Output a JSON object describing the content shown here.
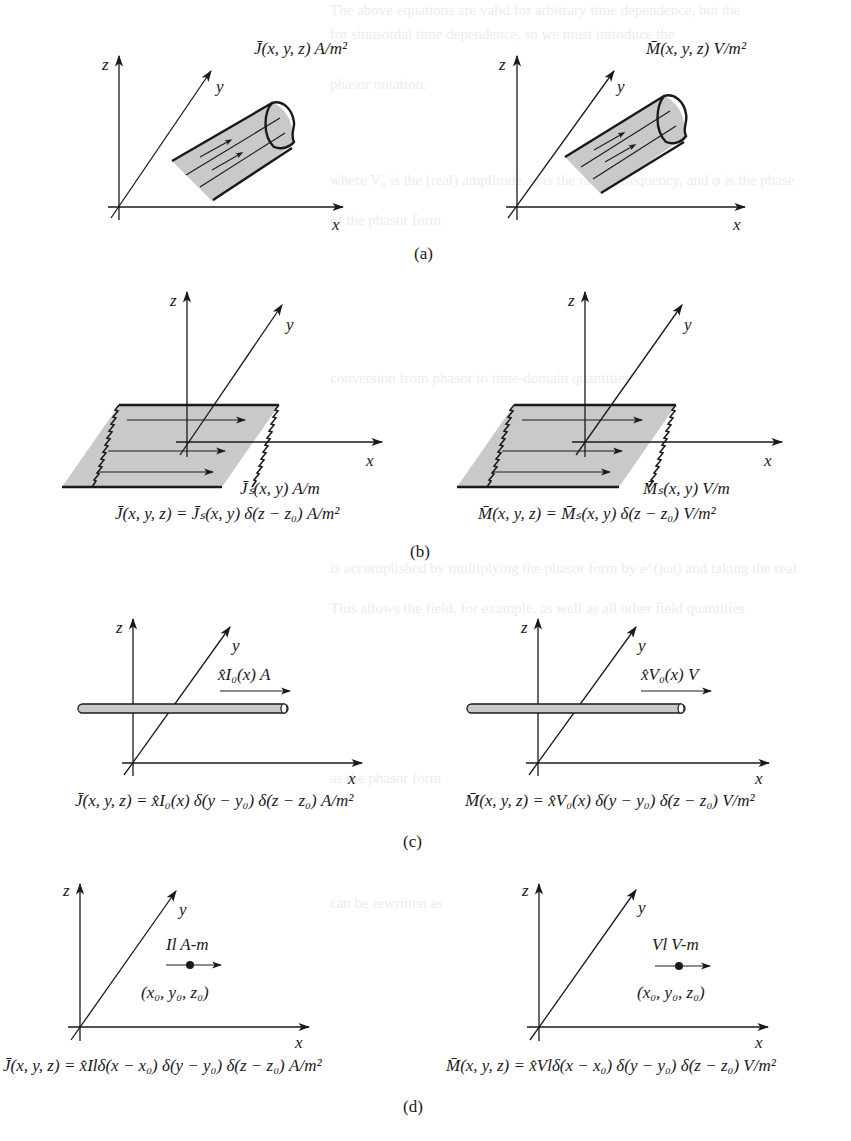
{
  "figure": {
    "panels": [
      {
        "id": "a",
        "caption": "(a)",
        "left": {
          "kind": "volume-current-tube",
          "label": "J̄(x, y, z) A/m²"
        },
        "right": {
          "kind": "volume-current-tube",
          "label": "M̄(x, y, z) V/m²"
        }
      },
      {
        "id": "b",
        "caption": "(b)",
        "left": {
          "kind": "surface-current-sheet",
          "sheet_label": "J̄ₛ(x, y) A/m",
          "equation": "J̄(x, y, z) = J̄ₛ(x, y) δ(z − z₀) A/m²"
        },
        "right": {
          "kind": "surface-current-sheet",
          "sheet_label": "M̄ₛ(x, y) V/m",
          "equation": "M̄(x, y, z) = M̄ₛ(x, y) δ(z − z₀) V/m²"
        }
      },
      {
        "id": "c",
        "caption": "(c)",
        "left": {
          "kind": "line-current",
          "line_label": "x̂I₀(x) A",
          "equation": "J̄(x, y, z) = x̂I₀(x) δ(y − y₀) δ(z − z₀) A/m²"
        },
        "right": {
          "kind": "line-current",
          "line_label": "x̂V₀(x) V",
          "equation": "M̄(x, y, z) = x̂V₀(x) δ(y − y₀) δ(z − z₀) V/m²"
        }
      },
      {
        "id": "d",
        "caption": "(d)",
        "left": {
          "kind": "point-dipole",
          "dipole_label": "Il A-m",
          "point_label": "(x₀, y₀, z₀)",
          "equation": "J̄(x, y, z) = x̂Ilδ(x − x₀) δ(y − y₀) δ(z − z₀) A/m²"
        },
        "right": {
          "kind": "point-dipole",
          "dipole_label": "Vl V-m",
          "point_label": "(x₀, y₀, z₀)",
          "equation": "M̄(x, y, z) = x̂Vlδ(x − x₀) δ(y − y₀) δ(z − z₀) V/m²"
        }
      }
    ],
    "axis_labels": {
      "x": "x",
      "y": "y",
      "z": "z"
    }
  },
  "bleed_through_text": [
    "The above equations are valid for arbitrary time dependence, but the",
    "for sinusoidal time dependence, so we must introduce the",
    "phasor notation.",
    "where V₀ is the (real) amplitude, ω is the radian frequency, and φ is the phase",
    "of the phasor form",
    "conversion from phasor to time-domain quantities",
    "is accomplished by multiplying the phasor form by e^(jωt) and taking the real",
    "This allows the field, for example, as well as all other field quantities",
    "as the phasor form",
    "can be rewritten as"
  ],
  "colors": {
    "ink": "#1a1a1a",
    "shade": "#c9c9c9",
    "background": "#ffffff",
    "bleed": "#ececec"
  }
}
